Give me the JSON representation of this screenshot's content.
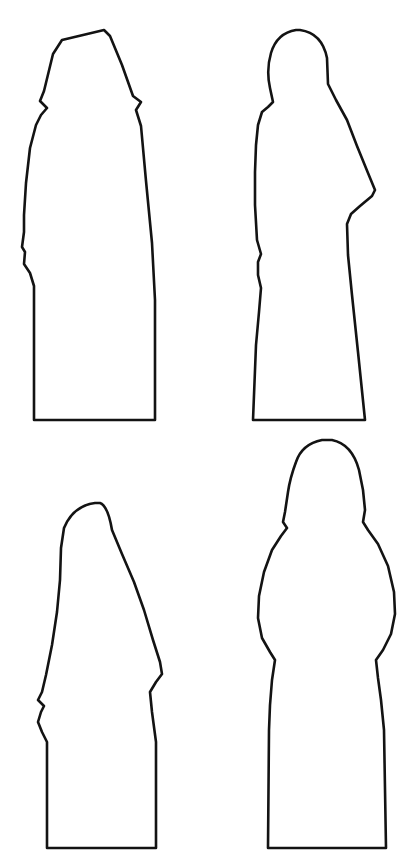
{
  "page": {
    "width": 413,
    "height": 850,
    "background_color": "#ffffff",
    "outline_color": "#131313",
    "fill_color": "#ffffff",
    "stroke_width": 2.6
  },
  "figures": [
    {
      "id": "figure-top-left",
      "label": "Hooded figure with angular peaked hood, left profile",
      "grid_position": "top-left",
      "bounds": {
        "x": 22,
        "y": 28,
        "width": 134,
        "height": 394
      },
      "head_style": "angular-peaked-hood",
      "base_style": "flat-horizontal",
      "path": "M 104 30 L 62 40 L 53 54 L 44 91 L 40 101 L 47 108 L 41 115 L 36 125 L 30 148 L 26 183 L 24 215 L 24 232 L 22 247 L 25 252 L 24 264 L 30 273 L 34 286 L 34 420 L 155 420 L 155 300 L 152 243 L 146 181 L 141 126 L 136 110 L 141 102 L 133 96 L 122 65 L 110 36 Z"
    },
    {
      "id": "figure-top-right",
      "label": "Standing robed figure with rounded head and draped right sleeve",
      "grid_position": "top-right",
      "bounds": {
        "x": 253,
        "y": 28,
        "width": 123,
        "height": 394
      },
      "head_style": "rounded-dome",
      "base_style": "flat-horizontal",
      "path": "M 296 30 Q 277 33 271 53 Q 266 70 270 88 L 273 102 L 268 107 L 262 112 L 258 125 L 256 145 L 255 172 L 255 205 L 257 240 L 261 254 L 258 262 L 258 275 L 261 288 L 259 312 L 256 345 L 253 420 L 365 420 L 358 352 L 352 295 L 348 255 L 347 224 L 351 214 L 360 206 L 372 196 L 375 190 L 368 173 L 357 146 L 347 120 L 336 100 L 328 84 L 327 58 Q 322 33 300 30 Z"
    },
    {
      "id": "figure-bottom-left",
      "label": "Hooded figure with smooth rounded dome hood, left profile",
      "grid_position": "bottom-left",
      "bounds": {
        "x": 35,
        "y": 500,
        "width": 127,
        "height": 348
      },
      "head_style": "rounded-dome",
      "base_style": "flat-horizontal",
      "path": "M 95 503 Q 73 506 64 528 L 61 548 L 60 580 L 57 612 L 52 645 L 46 675 L 42 692 L 38 700 L 44 706 L 41 712 L 38 722 L 42 732 L 47 742 L 47 848 L 156 848 L 156 742 L 152 712 L 150 692 L 156 682 L 162 674 L 160 662 L 153 640 L 144 610 L 134 582 L 122 554 L 112 530 Q 108 506 100 503 Z"
    },
    {
      "id": "figure-bottom-right",
      "label": "Broad frontal figure with bulbous shoulders and narrow waisted robe",
      "grid_position": "bottom-right",
      "bounds": {
        "x": 258,
        "y": 438,
        "width": 138,
        "height": 410
      },
      "head_style": "rounded-with-shoulder-bumps",
      "base_style": "flat-horizontal",
      "path": "M 322 440 Q 302 444 296 462 Q 290 478 288 492 L 285 512 L 283 522 L 287 528 L 281 536 L 272 550 L 264 572 L 259 596 L 258 618 L 262 638 L 270 652 L 275 660 L 272 680 L 270 705 L 269 730 L 268 848 L 386 848 L 384 730 L 381 700 L 378 678 L 376 660 L 383 650 L 391 634 L 395 614 L 394 592 L 388 566 L 378 544 L 368 530 L 363 522 L 365 510 L 363 490 L 359 470 Q 352 444 332 440 Z"
    }
  ]
}
